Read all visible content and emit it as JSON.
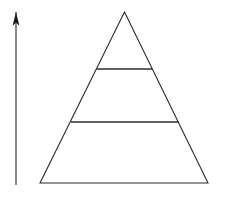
{
  "figure": {
    "background_color": "#ffffff",
    "width": 225,
    "height": 198
  },
  "chart_data": {
    "type": "diagram",
    "subtype": "pyramid",
    "title": "",
    "xlabel": "",
    "ylabel": "",
    "grid": false,
    "legend": null,
    "annotations": [],
    "pyramid": {
      "tier_count": 3,
      "apex": {
        "x": 124.5,
        "y": 12
      },
      "base_left": {
        "x": 40,
        "y": 183
      },
      "base_right": {
        "x": 208,
        "y": 183
      },
      "outline_color": "#2b2b2b",
      "fill_color": "none",
      "stroke_width": 1.1,
      "dividers": [
        {
          "y": 69,
          "x1": 97,
          "x2": 152,
          "label": ""
        },
        {
          "y": 122,
          "x1": 71,
          "x2": 179,
          "label": ""
        }
      ],
      "tiers": [
        {
          "index": 0,
          "name": "top-tier",
          "label": "",
          "top_y": 12,
          "bottom_y": 69,
          "top_width": 0,
          "bottom_width": 55
        },
        {
          "index": 1,
          "name": "middle-tier",
          "label": "",
          "top_y": 69,
          "bottom_y": 122,
          "top_width": 55,
          "bottom_width": 108
        },
        {
          "index": 2,
          "name": "bottom-tier",
          "label": "",
          "top_y": 122,
          "bottom_y": 183,
          "top_width": 108,
          "bottom_width": 168
        }
      ]
    },
    "axis_arrow": {
      "orientation": "vertical",
      "direction": "up",
      "label": "",
      "shaft_x": 16,
      "tip_y": 12,
      "tail_y": 185,
      "head_width": 7,
      "head_height": 14,
      "shaft_color": "#3a3a3a",
      "head_color": "#1c1c1c",
      "shaft_width": 1.2
    }
  }
}
